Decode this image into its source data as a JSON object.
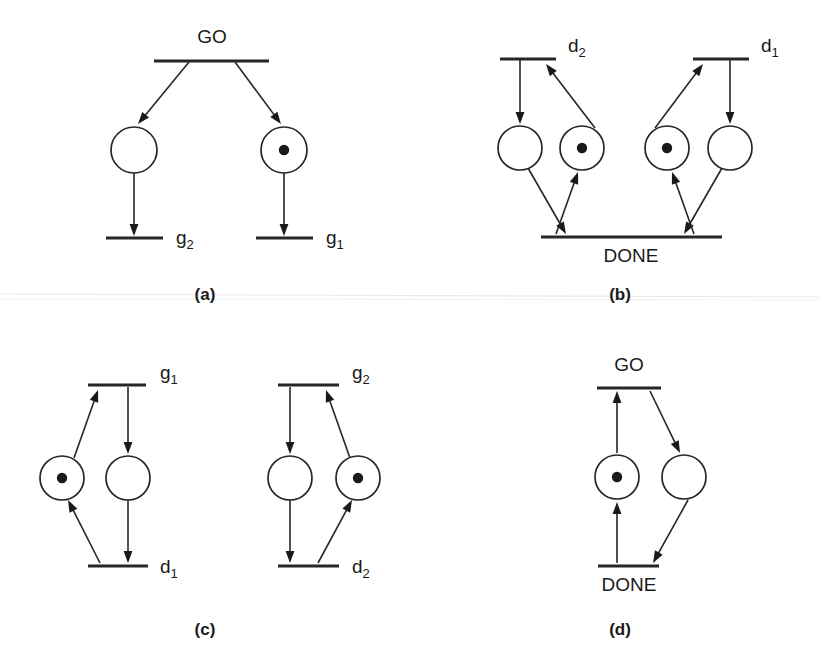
{
  "figure": {
    "type": "petri-net-diagram",
    "width": 819,
    "height": 668,
    "background_color": "#ffffff",
    "ink_color": "#262626",
    "token_color": "#1a1a1a",
    "panel_count": 4,
    "captions": [
      "(a)",
      "(b)",
      "(c)",
      "(d)"
    ]
  },
  "panels": [
    {
      "id": "a",
      "caption": "(a)",
      "caption_x": 205,
      "caption_y": 300,
      "description": "single input transition GO forking into two places each feeding a transition",
      "transitions": [
        {
          "name": "GO",
          "label": "GO",
          "label_base": "GO",
          "label_sub": "",
          "x1": 154,
          "y": 61,
          "x2": 269,
          "label_x": 212,
          "label_y": 43,
          "label_anchor": "middle"
        },
        {
          "name": "g2",
          "label": "g2",
          "label_base": "g",
          "label_sub": "2",
          "x1": 106,
          "y": 238,
          "x2": 163,
          "label_x": 176,
          "label_y": 244,
          "label_anchor": "start"
        },
        {
          "name": "g1",
          "label": "g1",
          "label_base": "g",
          "label_sub": "1",
          "x1": 256,
          "y": 238,
          "x2": 313,
          "label_x": 326,
          "label_y": 244,
          "label_anchor": "start"
        }
      ],
      "places": [
        {
          "name": "place-a-left",
          "cx": 134,
          "cy": 150,
          "r": 23,
          "tokens": 0
        },
        {
          "name": "place-a-right",
          "cx": 284,
          "cy": 150,
          "r": 23,
          "tokens": 1
        }
      ],
      "arcs": [
        {
          "name": "arc-go-to-left-place",
          "from": "GO",
          "to": "place-a-left",
          "x1": 189,
          "y1": 62,
          "x2": 138,
          "y2": 124
        },
        {
          "name": "arc-go-to-right-place",
          "from": "GO",
          "to": "place-a-right",
          "x1": 235,
          "y1": 62,
          "x2": 281,
          "y2": 124
        },
        {
          "name": "arc-left-place-to-g2",
          "from": "place-a-left",
          "to": "g2",
          "x1": 134,
          "y1": 173,
          "x2": 134,
          "y2": 236
        },
        {
          "name": "arc-right-place-to-g1",
          "from": "place-a-right",
          "to": "g1",
          "x1": 284,
          "y1": 173,
          "x2": 284,
          "y2": 236
        }
      ]
    },
    {
      "id": "b",
      "caption": "(b)",
      "caption_x": 620,
      "caption_y": 300,
      "description": "two mirrored place pairs between transitions d2 / d1 and a shared DONE transition",
      "transitions": [
        {
          "name": "d2",
          "label": "d2",
          "label_base": "d",
          "label_sub": "2",
          "x1": 500,
          "y": 59,
          "x2": 556,
          "label_x": 568,
          "label_y": 52,
          "label_anchor": "start"
        },
        {
          "name": "d1",
          "label": "d1",
          "label_base": "d",
          "label_sub": "1",
          "x1": 693,
          "y": 59,
          "x2": 749,
          "label_x": 761,
          "label_y": 52,
          "label_anchor": "start"
        },
        {
          "name": "DONE",
          "label": "DONE",
          "label_base": "DONE",
          "label_sub": "",
          "x1": 541,
          "y": 237,
          "x2": 722,
          "label_x": 631,
          "label_y": 262,
          "label_anchor": "middle"
        }
      ],
      "places": [
        {
          "name": "place-b-1",
          "cx": 520,
          "cy": 148,
          "r": 22,
          "tokens": 0
        },
        {
          "name": "place-b-2",
          "cx": 582,
          "cy": 148,
          "r": 22,
          "tokens": 1
        },
        {
          "name": "place-b-3",
          "cx": 667,
          "cy": 148,
          "r": 22,
          "tokens": 1
        },
        {
          "name": "place-b-4",
          "cx": 730,
          "cy": 148,
          "r": 22,
          "tokens": 0
        }
      ],
      "arcs": [
        {
          "name": "arc-d2-to-place-b1",
          "from": "d2",
          "to": "place-b-1",
          "x1": 520,
          "y1": 60,
          "x2": 520,
          "y2": 124
        },
        {
          "name": "arc-place-b2-to-d2",
          "from": "place-b-2",
          "to": "d2",
          "x1": 595,
          "y1": 128,
          "x2": 546,
          "y2": 64
        },
        {
          "name": "arc-place-b1-to-done",
          "from": "place-b-1",
          "to": "DONE",
          "x1": 528,
          "y1": 168,
          "x2": 566,
          "y2": 234
        },
        {
          "name": "arc-done-to-place-b2",
          "from": "DONE",
          "to": "place-b-2",
          "x1": 556,
          "y1": 234,
          "x2": 578,
          "y2": 172
        },
        {
          "name": "arc-d1-to-place-b4",
          "from": "d1",
          "to": "place-b-4",
          "x1": 730,
          "y1": 60,
          "x2": 730,
          "y2": 124
        },
        {
          "name": "arc-place-b3-to-d1",
          "from": "place-b-3",
          "to": "d1",
          "x1": 655,
          "y1": 128,
          "x2": 703,
          "y2": 64
        },
        {
          "name": "arc-place-b4-to-done",
          "from": "place-b-4",
          "to": "DONE",
          "x1": 722,
          "y1": 168,
          "x2": 684,
          "y2": 234
        },
        {
          "name": "arc-done-to-place-b3",
          "from": "DONE",
          "to": "place-b-3",
          "x1": 694,
          "y1": 234,
          "x2": 672,
          "y2": 172
        }
      ]
    },
    {
      "id": "c",
      "caption": "(c)",
      "caption_x": 205,
      "caption_y": 635,
      "description": "two independent cycles, left between g1 and d1, right between g2 and d2",
      "transitions": [
        {
          "name": "g1",
          "label": "g1",
          "label_base": "g",
          "label_sub": "1",
          "x1": 88,
          "y": 385,
          "x2": 146,
          "label_x": 160,
          "label_y": 379,
          "label_anchor": "start"
        },
        {
          "name": "d1",
          "label": "d1",
          "label_base": "d",
          "label_sub": "1",
          "x1": 88,
          "y": 566,
          "x2": 148,
          "label_x": 160,
          "label_y": 573,
          "label_anchor": "start"
        },
        {
          "name": "g2",
          "label": "g2",
          "label_base": "g",
          "label_sub": "2",
          "x1": 278,
          "y": 385,
          "x2": 339,
          "label_x": 352,
          "label_y": 379,
          "label_anchor": "start"
        },
        {
          "name": "d2",
          "label": "d2",
          "label_base": "d",
          "label_sub": "2",
          "x1": 278,
          "y": 566,
          "x2": 339,
          "label_x": 352,
          "label_y": 573,
          "label_anchor": "start"
        }
      ],
      "places": [
        {
          "name": "place-c-1",
          "cx": 62,
          "cy": 478,
          "r": 22,
          "tokens": 1
        },
        {
          "name": "place-c-2",
          "cx": 128,
          "cy": 478,
          "r": 22,
          "tokens": 0
        },
        {
          "name": "place-c-3",
          "cx": 290,
          "cy": 478,
          "r": 22,
          "tokens": 0
        },
        {
          "name": "place-c-4",
          "cx": 358,
          "cy": 478,
          "r": 22,
          "tokens": 1
        }
      ],
      "arcs": [
        {
          "name": "arc-place-c1-to-g1",
          "from": "place-c-1",
          "to": "g1",
          "x1": 74,
          "y1": 458,
          "x2": 98,
          "y2": 390
        },
        {
          "name": "arc-g1-to-place-c2",
          "from": "g1",
          "to": "place-c-2",
          "x1": 128,
          "y1": 387,
          "x2": 128,
          "y2": 454
        },
        {
          "name": "arc-place-c2-to-d1",
          "from": "place-c-2",
          "to": "d1",
          "x1": 128,
          "y1": 500,
          "x2": 128,
          "y2": 563
        },
        {
          "name": "arc-d1-to-place-c1",
          "from": "d1",
          "to": "place-c-1",
          "x1": 100,
          "y1": 563,
          "x2": 68,
          "y2": 500
        },
        {
          "name": "arc-g2-to-place-c3",
          "from": "g2",
          "to": "place-c-3",
          "x1": 290,
          "y1": 387,
          "x2": 290,
          "y2": 454
        },
        {
          "name": "arc-place-c4-to-g2",
          "from": "place-c-4",
          "to": "g2",
          "x1": 350,
          "y1": 458,
          "x2": 326,
          "y2": 390
        },
        {
          "name": "arc-place-c3-to-d2",
          "from": "place-c-3",
          "to": "d2",
          "x1": 290,
          "y1": 500,
          "x2": 290,
          "y2": 563
        },
        {
          "name": "arc-d2-to-place-c4",
          "from": "d2",
          "to": "place-c-4",
          "x1": 318,
          "y1": 563,
          "x2": 352,
          "y2": 500
        }
      ]
    },
    {
      "id": "d",
      "caption": "(d)",
      "caption_x": 620,
      "caption_y": 635,
      "description": "single cycle between transitions GO and DONE with one marked place",
      "transitions": [
        {
          "name": "GO",
          "label": "GO",
          "label_base": "GO",
          "label_sub": "",
          "x1": 597,
          "y": 388,
          "x2": 661,
          "label_x": 629,
          "label_y": 371,
          "label_anchor": "middle"
        },
        {
          "name": "DONE",
          "label": "DONE",
          "label_base": "DONE",
          "label_sub": "",
          "x1": 598,
          "y": 566,
          "x2": 659,
          "label_x": 629,
          "label_y": 591,
          "label_anchor": "middle"
        }
      ],
      "places": [
        {
          "name": "place-d-1",
          "cx": 617,
          "cy": 477,
          "r": 22,
          "tokens": 1
        },
        {
          "name": "place-d-2",
          "cx": 684,
          "cy": 477,
          "r": 22,
          "tokens": 0
        }
      ],
      "arcs": [
        {
          "name": "arc-place-d1-to-go",
          "from": "place-d-1",
          "to": "GO",
          "x1": 617,
          "y1": 453,
          "x2": 617,
          "y2": 391
        },
        {
          "name": "arc-go-to-place-d2",
          "from": "GO",
          "to": "place-d-2",
          "x1": 650,
          "y1": 391,
          "x2": 680,
          "y2": 453
        },
        {
          "name": "arc-place-d2-to-done",
          "from": "place-d-2",
          "to": "DONE",
          "x1": 688,
          "y1": 500,
          "x2": 653,
          "y2": 563
        },
        {
          "name": "arc-done-to-place-d1",
          "from": "DONE",
          "to": "place-d-1",
          "x1": 617,
          "y1": 563,
          "x2": 617,
          "y2": 502
        }
      ]
    }
  ],
  "artifacts": {
    "scan_lines": [
      {
        "name": "scan-line-upper",
        "x1": 0,
        "y1": 294,
        "x2": 819,
        "y2": 297
      },
      {
        "name": "scan-line-lower",
        "x1": 0,
        "y1": 299,
        "x2": 819,
        "y2": 300
      }
    ]
  }
}
